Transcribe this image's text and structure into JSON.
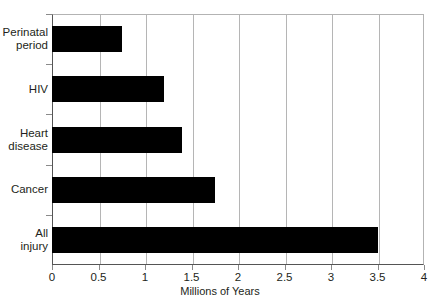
{
  "chart_data": {
    "type": "bar",
    "orientation": "horizontal",
    "title": "",
    "subtitle": "",
    "xlabel": "Millions of Years",
    "ylabel": "",
    "categories": [
      "Perinatal period",
      "HIV",
      "Heart disease",
      "Cancer",
      "All injury"
    ],
    "values": [
      0.75,
      1.2,
      1.4,
      1.75,
      3.5
    ],
    "xlim": [
      0,
      4
    ],
    "xticks": [
      0,
      0.5,
      1,
      1.5,
      2,
      2.5,
      3,
      3.5,
      4
    ],
    "xtick_labels": [
      "0",
      "0.5",
      "1",
      "1.5",
      "2",
      "2.5",
      "3",
      "3.5",
      "4"
    ],
    "grid": "vertical",
    "legend": "none",
    "bar_color": "#000000",
    "grid_color": "#b5b5b5",
    "axis_color": "#555555",
    "background_color": "#ffffff"
  }
}
